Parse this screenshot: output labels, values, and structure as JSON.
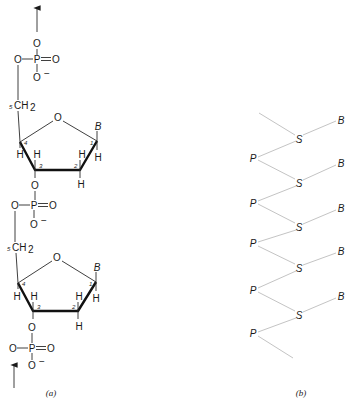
{
  "panel_a": {
    "caption": "(a)",
    "phosphate_top": {
      "o_up": "O",
      "o_left": "O",
      "p": "P",
      "o_double": "O",
      "o_minus": "O",
      "minus": "−"
    },
    "nucleotide_1": {
      "ch2": "CH",
      "ch2_sub": "2",
      "c5_label": "5",
      "ring_o": "O",
      "base": "B",
      "c1": "1",
      "c2": "2",
      "c3": "3",
      "c4": "4",
      "h_c4": "H",
      "h_c3": "H",
      "h_c2_up": "H",
      "h_c1": "H",
      "h_c2_down": "H",
      "o3": "O"
    },
    "phosphate_mid": {
      "o_left": "O",
      "p": "P",
      "o_double": "O",
      "o_minus": "O",
      "minus": "−"
    },
    "nucleotide_2": {
      "ch2": "CH",
      "ch2_sub": "2",
      "c5_label": "5",
      "ring_o": "O",
      "base": "B",
      "c1": "1",
      "c2": "2",
      "c3": "3",
      "c4": "4",
      "h_c4": "H",
      "h_c3": "H",
      "h_c2_up": "H",
      "h_c1": "H",
      "h_c2_down": "H",
      "o3": "O"
    },
    "phosphate_bottom": {
      "o_left": "O",
      "p": "P",
      "o_double": "O",
      "o_minus": "O",
      "minus": "−"
    }
  },
  "panel_b": {
    "caption": "(b)",
    "sugars": [
      "S",
      "S",
      "S",
      "S",
      "S"
    ],
    "phosphates": [
      "P",
      "P",
      "P",
      "P",
      "P"
    ],
    "bases": [
      "B",
      "B",
      "B",
      "B",
      "B"
    ]
  }
}
